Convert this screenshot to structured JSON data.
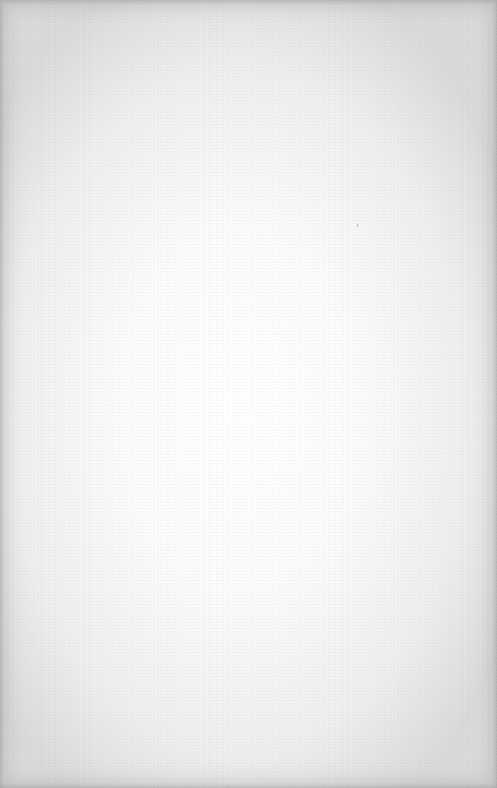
{
  "page": {
    "colors": {
      "center": "#ffffff",
      "mid": "#eeeeee",
      "edge": "#dadada"
    }
  }
}
